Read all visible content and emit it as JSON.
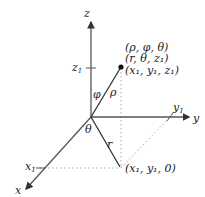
{
  "diagram": {
    "type": "3d-coordinate-system",
    "colors": {
      "axis": "#555555",
      "text": "#222222",
      "dotted": "#aaaaaa",
      "point": "#111111"
    },
    "axes": {
      "z": {
        "label": "z"
      },
      "y": {
        "label": "y"
      },
      "x": {
        "label": "x"
      }
    },
    "ticks": {
      "z1": {
        "base": "z",
        "sub": "1"
      },
      "y1": {
        "base": "y",
        "sub": "1"
      },
      "x1": {
        "base": "x",
        "sub": "1"
      }
    },
    "angles": {
      "phi": "φ",
      "theta": "θ"
    },
    "segments": {
      "rho": "ρ",
      "r": "r"
    },
    "point_labels": {
      "spherical": "(ρ, φ, θ)",
      "cylindrical": "(r, θ, z₁)",
      "cartesian": "(x₁, y₁, z₁)"
    },
    "projection_label": "(x₁, y₁, 0)"
  }
}
